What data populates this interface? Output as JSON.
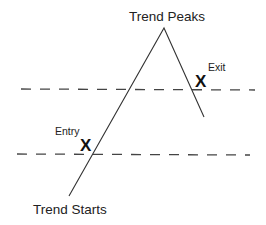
{
  "diagram": {
    "colors": {
      "line": "#333333",
      "dash": "#444444",
      "text": "#222222",
      "background": "#ffffff"
    },
    "labels": {
      "peak": "Trend Peaks",
      "start": "Trend Starts",
      "entry": "Entry",
      "exit": "Exit"
    },
    "markers": {
      "entry": "X",
      "exit": "X"
    },
    "trend_path": {
      "start": [
        69,
        196
      ],
      "peak": [
        164,
        28
      ],
      "end": [
        204,
        117
      ]
    },
    "levels": [
      {
        "name": "upper-level",
        "y": 89,
        "x_start": 21,
        "x_end": 255
      },
      {
        "name": "lower-level",
        "y": 154,
        "x_start": 17,
        "x_end": 250
      }
    ]
  }
}
